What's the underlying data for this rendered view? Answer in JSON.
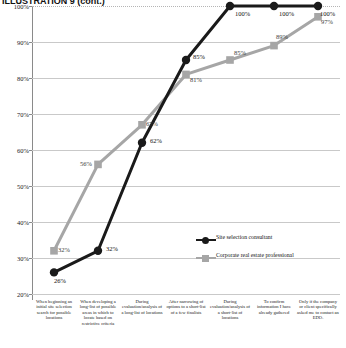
{
  "title": "ILLUSTRATION 9 (cont.)",
  "chart_data": {
    "type": "line",
    "title": "",
    "xlabel": "",
    "ylabel": "",
    "ylim": [
      20,
      100
    ],
    "ytick_labels": [
      "100%",
      "90%",
      "80%",
      "70%",
      "60%",
      "50%",
      "40%",
      "30%",
      "20%"
    ],
    "ytick_values": [
      100,
      90,
      80,
      70,
      60,
      50,
      40,
      30,
      20
    ],
    "grid": true,
    "legend_position": "inside-right",
    "categories": [
      "When beginning an initial site selection search for possible locations",
      "When developing a long-list of possible areas in which to locate based on restrictive criteria",
      "During evaluation/analysis of a long-list of locations",
      "After narrowing of options to a short-list of a few finalists",
      "During evaluation/analysis of a short-list of locations",
      "To confirm information I have already gathered",
      "Only if the company or client specifically asked me to contact an EDO."
    ],
    "series": [
      {
        "name": "Site selection consultant",
        "color": "#1a1a1a",
        "marker": "circle",
        "values": [
          26,
          32,
          62,
          85,
          100,
          100,
          100
        ],
        "labels": [
          "26%",
          "32%",
          "62%",
          "85%",
          "100%",
          "100%",
          "100%"
        ]
      },
      {
        "name": "Corporate real estate professional",
        "color": "#a6a6a6",
        "marker": "square",
        "values": [
          32,
          56,
          67,
          81,
          85,
          89,
          97
        ],
        "labels": [
          "32%",
          "56%",
          "67%",
          "81%",
          "85%",
          "89%",
          "97%"
        ]
      }
    ]
  }
}
